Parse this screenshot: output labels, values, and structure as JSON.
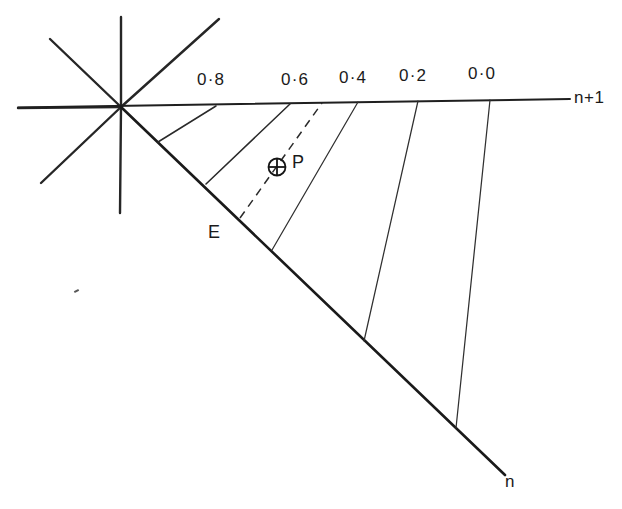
{
  "figure": {
    "title": "",
    "background_color": "#ffffff",
    "line_color": "#1a1a1a",
    "width": 622,
    "height": 509
  },
  "axes": {
    "upper": {
      "name": "n-plus-one-axis",
      "label": "n+1",
      "label_x": 574,
      "label_y": 88,
      "x1": 18,
      "y1": 107,
      "x2": 570,
      "y2": 99
    },
    "lower": {
      "name": "n-axis",
      "label": "n",
      "label_x": 505,
      "label_y": 472,
      "x1": 121,
      "y1": 107,
      "x2": 505,
      "y2": 475
    }
  },
  "origin": {
    "x": 121,
    "y": 107,
    "star_rays": [
      {
        "name": "ray-west",
        "x2": 18,
        "y2": 108
      },
      {
        "name": "ray-north",
        "x2": 121,
        "y2": 17
      },
      {
        "name": "ray-south",
        "x2": 120,
        "y2": 213
      },
      {
        "name": "ray-northeast",
        "x2": 219,
        "y2": 19
      },
      {
        "name": "ray-northwest",
        "x2": 50,
        "y2": 39
      },
      {
        "name": "ray-southwest",
        "x2": 41,
        "y2": 183
      }
    ]
  },
  "tick_labels": [
    {
      "id": "t08",
      "text": "0·8",
      "x": 197,
      "y": 70
    },
    {
      "id": "t06",
      "text": "0·6",
      "x": 281,
      "y": 70
    },
    {
      "id": "t04",
      "text": "0·4",
      "x": 339,
      "y": 68
    },
    {
      "id": "t02",
      "text": "0·2",
      "x": 399,
      "y": 66
    },
    {
      "id": "t00",
      "text": "0·0",
      "x": 468,
      "y": 64
    }
  ],
  "radial_lines": [
    {
      "id": "r-inner-1",
      "name": "radial-line-inner-1",
      "style": "solid",
      "x1": 158,
      "y1": 142,
      "x2": 216,
      "y2": 106
    },
    {
      "id": "r-08",
      "name": "radial-line-0-8",
      "style": "solid",
      "x1": 206,
      "y1": 184,
      "x2": 290,
      "y2": 104
    },
    {
      "id": "r-06",
      "name": "radial-line-0-6",
      "style": "dashed",
      "x1": 240,
      "y1": 218,
      "x2": 322,
      "y2": 103
    },
    {
      "id": "r-04",
      "name": "radial-line-0-4",
      "style": "solid",
      "x1": 272,
      "y1": 250,
      "x2": 358,
      "y2": 102
    },
    {
      "id": "r-02",
      "name": "radial-line-0-2",
      "style": "solid",
      "x1": 364,
      "y1": 341,
      "x2": 418,
      "y2": 101
    },
    {
      "id": "r-00",
      "name": "radial-line-0-0",
      "style": "solid",
      "x1": 456,
      "y1": 428,
      "x2": 490,
      "y2": 100
    }
  ],
  "markers": {
    "point_p": {
      "name": "point-p-marker",
      "symbol": "circled-cross",
      "cx": 277,
      "cy": 167,
      "r": 8.5,
      "label": "P",
      "label_x": 292,
      "label_y": 152
    },
    "point_e": {
      "name": "point-e-label",
      "label": "E",
      "label_x": 208,
      "label_y": 222
    }
  },
  "artifacts": [
    {
      "name": "scan-speck",
      "x": 74,
      "y": 290
    }
  ]
}
